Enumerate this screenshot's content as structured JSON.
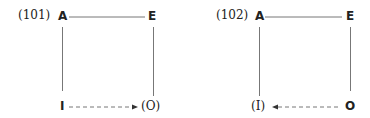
{
  "diagrams": [
    {
      "label": "(101)",
      "corners": {
        "top_left": "A",
        "top_right": "E",
        "bottom_left": "I",
        "bottom_right": "(O)"
      },
      "arrow": {
        "from": "I",
        "to": "(O)",
        "style": "dashed",
        "direction": "right"
      }
    },
    {
      "label": "(102)",
      "corners": {
        "top_left": "A",
        "top_right": "E",
        "bottom_left": "(I)",
        "bottom_right": "O"
      },
      "arrow": {
        "from": "O",
        "to": "(I)",
        "style": "dashed",
        "direction": "left"
      }
    }
  ],
  "colors": {
    "line": "#777777",
    "text": "#222222"
  }
}
